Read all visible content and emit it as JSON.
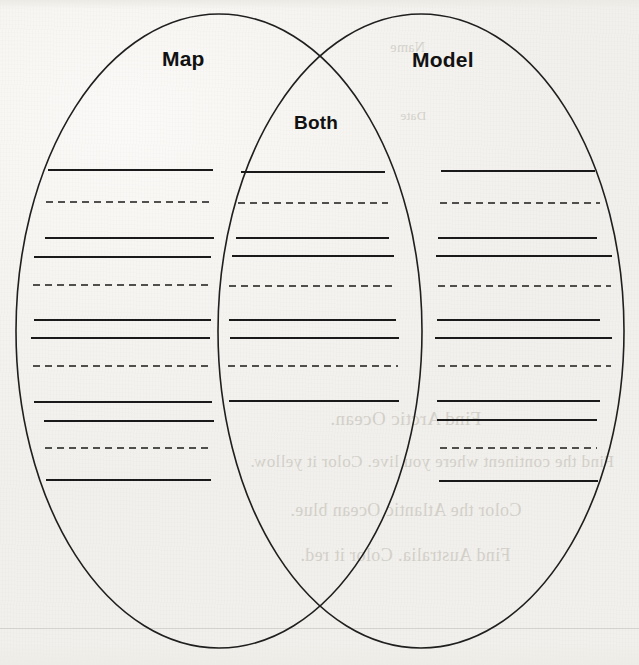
{
  "document": {
    "type": "venn-diagram-worksheet",
    "background_color": "#f4f3ef",
    "ink_color": "#1a1a1a"
  },
  "labels": {
    "left": "Map",
    "right": "Model",
    "overlap": "Both"
  },
  "diagram": {
    "left_ellipse": {
      "cx": 219,
      "cy": 331,
      "rx": 203,
      "ry": 317
    },
    "right_ellipse": {
      "cx": 421,
      "cy": 331,
      "rx": 203,
      "ry": 317
    },
    "stroke_color": "#1f1f1f",
    "stroke_width": 1.6,
    "fill": "none"
  },
  "writing_lines": {
    "left_section": [
      {
        "y": 170,
        "x1": 48,
        "x2": 213,
        "style": "solid"
      },
      {
        "y": 202,
        "x1": 46,
        "x2": 214,
        "style": "dashed"
      },
      {
        "y": 238,
        "x1": 45,
        "x2": 214,
        "style": "solid"
      },
      {
        "y": 257,
        "x1": 34,
        "x2": 211,
        "style": "solid"
      },
      {
        "y": 285,
        "x1": 33,
        "x2": 213,
        "style": "dashed"
      },
      {
        "y": 320,
        "x1": 34,
        "x2": 211,
        "style": "solid"
      },
      {
        "y": 338,
        "x1": 31,
        "x2": 210,
        "style": "solid"
      },
      {
        "y": 366,
        "x1": 33,
        "x2": 213,
        "style": "dashed"
      },
      {
        "y": 402,
        "x1": 34,
        "x2": 212,
        "style": "solid"
      },
      {
        "y": 421,
        "x1": 44,
        "x2": 214,
        "style": "solid"
      },
      {
        "y": 448,
        "x1": 45,
        "x2": 213,
        "style": "dashed"
      },
      {
        "y": 480,
        "x1": 46,
        "x2": 211,
        "style": "solid"
      }
    ],
    "middle_section": [
      {
        "y": 172,
        "x1": 241,
        "x2": 385,
        "style": "solid"
      },
      {
        "y": 203,
        "x1": 238,
        "x2": 388,
        "style": "dashed"
      },
      {
        "y": 238,
        "x1": 236,
        "x2": 389,
        "style": "solid"
      },
      {
        "y": 256,
        "x1": 232,
        "x2": 394,
        "style": "solid"
      },
      {
        "y": 286,
        "x1": 229,
        "x2": 396,
        "style": "dashed"
      },
      {
        "y": 320,
        "x1": 229,
        "x2": 396,
        "style": "solid"
      },
      {
        "y": 338,
        "x1": 230,
        "x2": 399,
        "style": "solid"
      },
      {
        "y": 366,
        "x1": 228,
        "x2": 398,
        "style": "dashed"
      },
      {
        "y": 401,
        "x1": 229,
        "x2": 399,
        "style": "solid"
      }
    ],
    "right_section": [
      {
        "y": 171,
        "x1": 441,
        "x2": 595,
        "style": "solid"
      },
      {
        "y": 203,
        "x1": 440,
        "x2": 600,
        "style": "dashed"
      },
      {
        "y": 238,
        "x1": 438,
        "x2": 597,
        "style": "solid"
      },
      {
        "y": 256,
        "x1": 436,
        "x2": 612,
        "style": "solid"
      },
      {
        "y": 286,
        "x1": 438,
        "x2": 611,
        "style": "dashed"
      },
      {
        "y": 320,
        "x1": 437,
        "x2": 600,
        "style": "solid"
      },
      {
        "y": 338,
        "x1": 435,
        "x2": 612,
        "style": "solid"
      },
      {
        "y": 366,
        "x1": 438,
        "x2": 611,
        "style": "dashed"
      },
      {
        "y": 401,
        "x1": 437,
        "x2": 600,
        "style": "solid"
      },
      {
        "y": 420,
        "x1": 437,
        "x2": 597,
        "style": "solid"
      },
      {
        "y": 448,
        "x1": 440,
        "x2": 597,
        "style": "dashed"
      },
      {
        "y": 481,
        "x1": 439,
        "x2": 598,
        "style": "solid"
      }
    ]
  },
  "bleed_through": [
    {
      "text": "Find Arctic Ocean.",
      "x": 330,
      "y": 408,
      "size": 19
    },
    {
      "text": "Find the continent where you live. Color it yellow.",
      "x": 250,
      "y": 452,
      "size": 17
    },
    {
      "text": "Color the Atlantic Ocean blue.",
      "x": 290,
      "y": 500,
      "size": 18
    },
    {
      "text": "Find Australia. Color it red.",
      "x": 300,
      "y": 545,
      "size": 18
    },
    {
      "text": "Name",
      "x": 390,
      "y": 40,
      "size": 14
    },
    {
      "text": "Date",
      "x": 400,
      "y": 108,
      "size": 13
    }
  ]
}
